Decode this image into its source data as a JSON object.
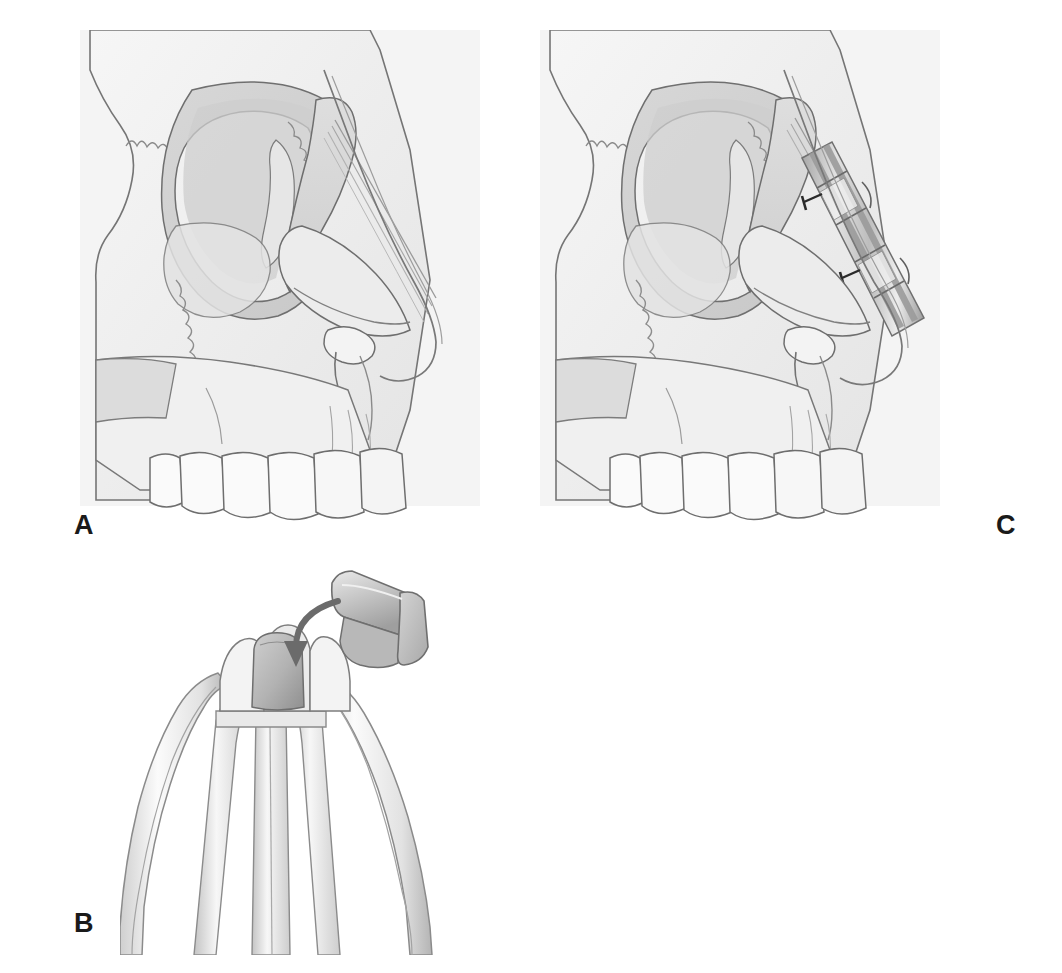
{
  "figure": {
    "kind": "medical-illustration",
    "background_color": "#ffffff",
    "panel_count": 3
  },
  "labels": {
    "a": "A",
    "b": "B",
    "c": "C"
  },
  "panels": [
    {
      "id": "a",
      "label": "A",
      "caption_text": "A",
      "description": "Lateral view of skull showing the nasal dorsum, orbit, zygoma, maxilla and maxillary dentition prior to graft placement",
      "structures": [
        "frontal-bone",
        "orbital-rim",
        "orbit",
        "nasal-bone",
        "frontal-process-of-maxilla",
        "zygomatic-bone",
        "zygomaticomaxillary-suture",
        "piriform-aperture",
        "anterior-nasal-spine",
        "maxilla",
        "maxillary-teeth",
        "soft-tissue-nasal-profile"
      ]
    },
    {
      "id": "b",
      "label": "B",
      "caption_text": "B",
      "description": "Three-pronged grasping forceps holding a rectangular bone graft block; curved arrow indicates loading of the graft into the instrument jaws",
      "structures": [
        "forceps-jaws",
        "forceps-shafts",
        "graft-block",
        "insertion-arrow"
      ]
    },
    {
      "id": "c",
      "label": "C",
      "caption_text": "C",
      "description": "Same lateral skull view with the dorsal onlay graft seated along the nasal dorsum and secured with two fixation screws",
      "structures": [
        "dorsal-onlay-graft",
        "graft-segment-band",
        "fixation-screw-upper",
        "fixation-screw-lower",
        "nasal-bone",
        "orbit",
        "maxillary-teeth",
        "soft-tissue-nasal-profile"
      ],
      "screw_count": 2,
      "graft_band_count": 4
    }
  ],
  "colors": {
    "paper": "#ffffff",
    "panel_tint": "#f4f4f4",
    "bone_fill": "#f2f2f2",
    "bone_shade_light": "#e8e8e8",
    "bone_shade_mid": "#d8d8d8",
    "bone_shade_dark": "#c6c6c6",
    "outline": "#6e6e6e",
    "outline_dark": "#4a4a4a",
    "graft_light": "#d9d9d9",
    "graft_dark": "#9a9a9a",
    "instrument_light": "#ededed",
    "instrument_mid": "#cfcfcf",
    "instrument_dark": "#9b9b9b",
    "arrow": "#6b6b6b",
    "label_text": "#1a1a1a"
  }
}
